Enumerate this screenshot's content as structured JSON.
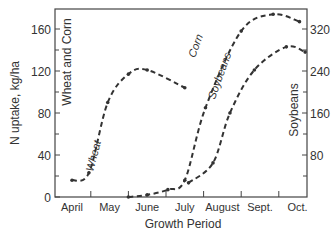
{
  "chart_data": {
    "type": "line",
    "title": "",
    "xlabel": "Growth Period",
    "ylabel": "N uptake, kg/ha",
    "ylabel_right": "Soybeans",
    "y_inner_label": "Wheat and Corn",
    "categories": [
      "April",
      "May",
      "June",
      "July",
      "August",
      "Sept.",
      "Oct."
    ],
    "left_axis": {
      "ylim": [
        0,
        180
      ],
      "ticks": [
        0,
        40,
        80,
        120,
        160
      ],
      "minor_ticks": [
        20,
        60,
        100,
        140
      ]
    },
    "right_axis": {
      "ylim": [
        0,
        360
      ],
      "ticks": [
        80,
        160,
        240,
        320
      ],
      "minor_ticks": [
        40,
        120,
        200,
        280
      ]
    },
    "grid": false,
    "series": [
      {
        "name": "Wheat",
        "axis": "left",
        "x": [
          0.0,
          0.45,
          0.95,
          1.5,
          2.0,
          3.0
        ],
        "values": [
          16,
          23,
          90,
          117,
          121,
          104
        ]
      },
      {
        "name": "Corn",
        "axis": "left",
        "x": [
          1.5,
          2.0,
          2.55,
          3.0,
          3.55,
          4.5,
          5.35,
          6.05
        ],
        "values": [
          0,
          2,
          7,
          16,
          85,
          158,
          174,
          167
        ]
      },
      {
        "name": "Soybeans",
        "axis": "right",
        "x": [
          3.1,
          3.75,
          4.2,
          4.85,
          5.7,
          6.2
        ],
        "values": [
          27,
          65,
          160,
          242,
          286,
          276
        ]
      }
    ],
    "annotations": [
      "Wheat",
      "Corn",
      "Soybeans",
      "Wheat and Corn"
    ]
  },
  "labels": {
    "xlabel": "Growth Period",
    "ylabel": "N uptake, kg/ha",
    "ylabel_right": "Soybeans",
    "inner_left": "Wheat and Corn",
    "wheat": "Wheat",
    "corn": "Corn",
    "soybeans": "Soybeans",
    "months": [
      "April",
      "May",
      "June",
      "July",
      "August",
      "Sept.",
      "Oct."
    ],
    "left_ticks": [
      "0",
      "40",
      "80",
      "120",
      "160"
    ],
    "right_ticks": [
      "80",
      "160",
      "240",
      "320"
    ]
  }
}
